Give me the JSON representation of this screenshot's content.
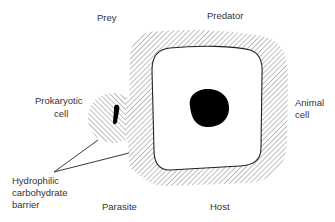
{
  "diagram": {
    "type": "schematic",
    "labels": {
      "prey": "Prey",
      "predator": "Predator",
      "prokaryotic_cell_line1": "Prokaryotic",
      "prokaryotic_cell_line2": "cell",
      "animal_cell_line1": "Animal",
      "animal_cell_line2": "cell",
      "barrier_line1": "Hydrophilic",
      "barrier_line2": "carbohydrate",
      "barrier_line3": "barrier",
      "parasite": "Parasite",
      "host": "Host"
    },
    "colors": {
      "ink": "#111111",
      "hatch": "#777777",
      "text": "#333333",
      "background": "#ffffff"
    }
  }
}
